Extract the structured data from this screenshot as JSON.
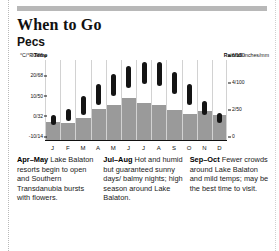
{
  "header": {
    "title": "When to Go",
    "subtitle": "Pecs"
  },
  "chart_data": {
    "type": "bar",
    "title": "Pecs",
    "categories": [
      "J",
      "F",
      "M",
      "A",
      "M",
      "J",
      "J",
      "A",
      "S",
      "O",
      "N",
      "D"
    ],
    "month_labels": [
      "J",
      "F",
      "M",
      "A",
      "M",
      "J",
      "J",
      "A",
      "S",
      "O",
      "N",
      "D"
    ],
    "grid": true,
    "legend": "none",
    "left_axis": {
      "label": "°C/°F",
      "label_bold": "Temp",
      "ticks": [
        "30/86",
        "20/68",
        "10/50",
        "0/32",
        "-10/14"
      ],
      "tick_values": [
        30,
        20,
        10,
        0,
        -10
      ],
      "ylim": [
        -10,
        30
      ],
      "unit": "°C/°F"
    },
    "right_axis": {
      "label_bold": "Rainfall",
      "label": "inches/mm",
      "ticks": [
        "6/150",
        "4/100",
        "2/50",
        "0"
      ],
      "tick_values": [
        6,
        4,
        2,
        0
      ],
      "ylim": [
        0,
        6
      ],
      "unit": "inches/mm"
    },
    "series": [
      {
        "name": "Temperature range",
        "type": "range-capsule",
        "color": "#141414",
        "axis": "left",
        "low": [
          -2,
          0,
          3,
          8,
          12,
          16,
          18,
          17,
          13,
          8,
          3,
          -1
        ],
        "high": [
          3,
          6,
          12,
          18,
          23,
          27,
          29,
          29,
          24,
          18,
          10,
          4
        ]
      },
      {
        "name": "Rainfall",
        "type": "bar",
        "color": "#9a9a9a",
        "axis": "right",
        "values": [
          1.4,
          1.3,
          1.7,
          2.4,
          2.7,
          3.2,
          2.8,
          2.7,
          2.3,
          2.0,
          2.2,
          1.9
        ]
      }
    ]
  },
  "notes": [
    {
      "period": "Apr–May",
      "text": " Lake Balaton resorts begin to open and Southern Transdanubia bursts with flowers."
    },
    {
      "period": "Jul–Aug",
      "text": " Hot and humid but guaranteed sunny days/ balmy nights; high season around Lake Balaton."
    },
    {
      "period": "Sep–Oct",
      "text": " Fewer crowds around Lake Balaton and mild temps; may be the best time to visit."
    }
  ]
}
